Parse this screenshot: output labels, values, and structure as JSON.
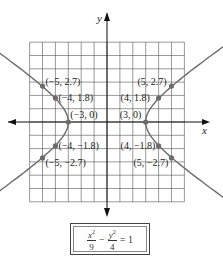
{
  "axes": {
    "x_label": "x",
    "y_label": "y",
    "grid_min": -6,
    "grid_max": 6
  },
  "points": [
    {
      "x": -5,
      "y": 2.7,
      "label": "(−5, 2.7)"
    },
    {
      "x": -4,
      "y": 1.8,
      "label": "(−4, 1.8)"
    },
    {
      "x": -3,
      "y": 0,
      "label": "(−3, 0)"
    },
    {
      "x": -4,
      "y": -1.8,
      "label": "(−4, −1.8)"
    },
    {
      "x": -5,
      "y": -2.7,
      "label": "(−5, −2.7)"
    },
    {
      "x": 5,
      "y": 2.7,
      "label": "(5, 2.7)"
    },
    {
      "x": 4,
      "y": 1.8,
      "label": "(4, 1.8)"
    },
    {
      "x": 3,
      "y": 0,
      "label": "(3, 0)"
    },
    {
      "x": 4,
      "y": -1.8,
      "label": "(4, −1.8)"
    },
    {
      "x": 5,
      "y": -2.7,
      "label": "(5, −2.7)"
    }
  ],
  "equation": {
    "term1_num": "x",
    "term1_den": "9",
    "term2_num": "y",
    "term2_den": "4",
    "exponent": "2",
    "minus": "−",
    "rhs": "= 1"
  },
  "colors": {
    "curve": "#6b6b6b",
    "point": "#6b6b6b",
    "grid": "#555555",
    "axis": "#111111"
  }
}
